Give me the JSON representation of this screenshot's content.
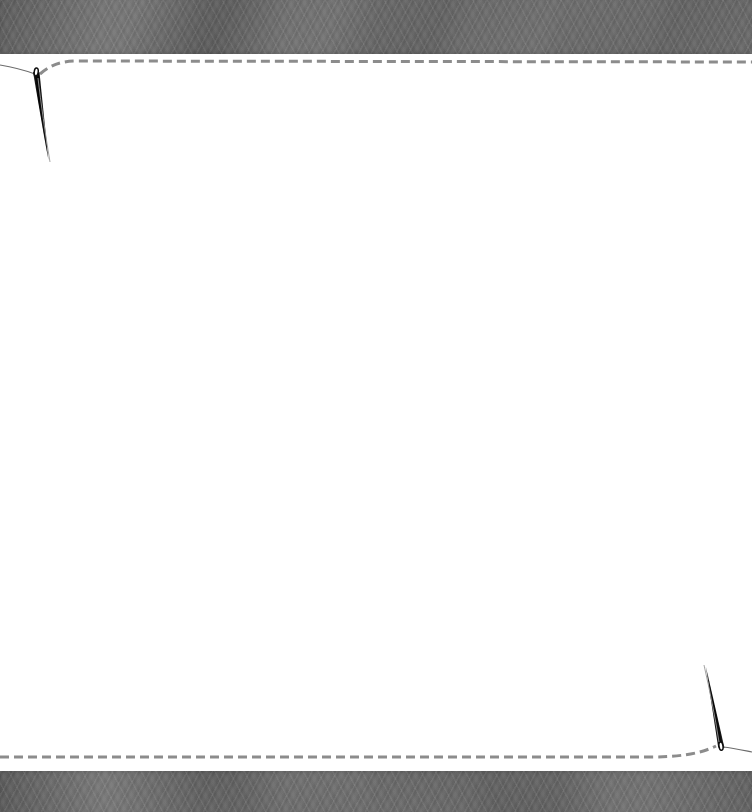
{
  "scene": {
    "title": "Sewing needles stitching a dashed seam on white cloth",
    "width": 752,
    "height": 812,
    "background_color": "#ffffff",
    "cloth_color": "#ffffff",
    "band_color": "#666666",
    "stitch_color": "#8c8c8c",
    "needle_color": "#111111",
    "thread_color": "#6b6b6b"
  },
  "bands": [
    {
      "name": "top-fabric-band",
      "position": "top",
      "y": 0,
      "height": 54,
      "color": "#666666",
      "texture": "woven-fabric"
    },
    {
      "name": "bottom-fabric-band",
      "position": "bottom",
      "y": 771,
      "height": 41,
      "color": "#666666",
      "texture": "woven-fabric"
    }
  ],
  "stitch_lines": [
    {
      "name": "top-stitch-seam",
      "y": 63,
      "x_start": 60,
      "x_end": 752,
      "dash_length": 9,
      "dash_gap": 5,
      "color": "#8c8c8c",
      "stroke_width": 3
    },
    {
      "name": "bottom-stitch-seam",
      "y": 757,
      "x_start": 0,
      "x_end": 694,
      "dash_length": 9,
      "dash_gap": 5,
      "color": "#8c8c8c",
      "stroke_width": 3
    }
  ],
  "needles": [
    {
      "name": "top-left-needle",
      "orientation": "pointing-down",
      "eye_x": 36,
      "eye_y": 73,
      "tip_x": 48,
      "tip_y": 161,
      "length": 89,
      "color": "#111111"
    },
    {
      "name": "bottom-right-needle",
      "orientation": "pointing-up",
      "eye_x": 721,
      "eye_y": 747,
      "tip_x": 706,
      "tip_y": 667,
      "length": 81,
      "color": "#111111"
    }
  ],
  "threads": [
    {
      "name": "top-left-thread",
      "from": "left-edge",
      "to": "top-left-needle-eye",
      "color": "#6b6b6b"
    },
    {
      "name": "top-left-thread-tail",
      "from": "top-left-needle-eye",
      "to": "below-needle-tip",
      "color": "#9a9a9a"
    },
    {
      "name": "bottom-right-thread",
      "from": "bottom-right-needle-eye",
      "to": "right-edge",
      "color": "#6b6b6b"
    },
    {
      "name": "bottom-right-thread-tail",
      "from": "bottom-right-needle-eye",
      "to": "above-needle-tip",
      "color": "#9a9a9a"
    }
  ],
  "content_area": {
    "name": "blank-cloth-area",
    "x": 0,
    "y": 54,
    "width": 752,
    "height": 717,
    "text": ""
  }
}
